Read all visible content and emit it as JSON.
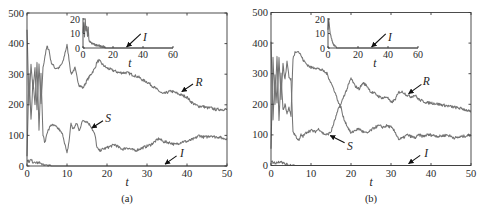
{
  "figure": {
    "panels": [
      "(a)",
      "(b)"
    ]
  },
  "chart_data": [
    {
      "type": "line",
      "panel_label": "(a)",
      "title": "",
      "xlabel": "t",
      "ylabel": "",
      "xlim": [
        0,
        50
      ],
      "ylim": [
        0,
        500
      ],
      "xticks": [
        0,
        10,
        20,
        30,
        40,
        50
      ],
      "yticks": [
        0,
        100,
        200,
        300,
        400,
        500
      ],
      "grid": false,
      "legend": "none (arrow annotations)",
      "series": [
        {
          "name": "R",
          "x": [
            0,
            0.5,
            1,
            1.5,
            2,
            2.5,
            3,
            3.5,
            4,
            4.5,
            5,
            5.5,
            6,
            7,
            8,
            9,
            9.5,
            10,
            10.5,
            11,
            11.5,
            12,
            12.5,
            13,
            14,
            15,
            16,
            17,
            17.5,
            18,
            19,
            20,
            21,
            22,
            23,
            24,
            25,
            26,
            27,
            28,
            29,
            30,
            31,
            32,
            33,
            34,
            35,
            36,
            37,
            38,
            39,
            40,
            41,
            42,
            43,
            44,
            45,
            46,
            47,
            48,
            49,
            50
          ],
          "y": [
            450,
            200,
            330,
            250,
            320,
            180,
            330,
            200,
            320,
            360,
            390,
            380,
            340,
            320,
            320,
            340,
            370,
            395,
            350,
            300,
            310,
            320,
            290,
            265,
            255,
            280,
            300,
            320,
            340,
            345,
            330,
            320,
            315,
            310,
            305,
            305,
            305,
            300,
            295,
            290,
            280,
            275,
            265,
            255,
            245,
            235,
            240,
            245,
            240,
            235,
            230,
            225,
            210,
            200,
            195,
            195,
            190,
            190,
            185,
            185,
            185,
            185
          ]
        },
        {
          "name": "S",
          "x": [
            0,
            0.5,
            1,
            1.5,
            2,
            2.5,
            3,
            3.5,
            4,
            4.5,
            5,
            5.5,
            6,
            7,
            8,
            9,
            9.5,
            10,
            10.5,
            11,
            11.5,
            12,
            12.5,
            13,
            14,
            15,
            16,
            17,
            17.5,
            18,
            19,
            20,
            21,
            22,
            23,
            24,
            25,
            26,
            27,
            28,
            29,
            30,
            31,
            32,
            33,
            34,
            35,
            36,
            37,
            38,
            39,
            40,
            41,
            42,
            43,
            44,
            45,
            46,
            47,
            48,
            49,
            50
          ],
          "y": [
            30,
            300,
            150,
            280,
            200,
            340,
            120,
            300,
            100,
            75,
            110,
            120,
            135,
            130,
            120,
            100,
            70,
            40,
            80,
            140,
            120,
            130,
            140,
            115,
            150,
            145,
            130,
            100,
            60,
            50,
            55,
            60,
            65,
            70,
            60,
            55,
            60,
            55,
            50,
            55,
            60,
            65,
            70,
            80,
            90,
            80,
            78,
            75,
            70,
            75,
            80,
            80,
            85,
            90,
            100,
            95,
            95,
            100,
            95,
            95,
            90,
            90
          ]
        },
        {
          "name": "I",
          "x": [
            0,
            0.5,
            1,
            1.5,
            2,
            2.5,
            3,
            3.5,
            4,
            4.5,
            5,
            6,
            50
          ],
          "y": [
            18,
            15,
            20,
            12,
            15,
            10,
            12,
            5,
            8,
            2,
            1,
            0,
            0
          ]
        }
      ],
      "annotations": [
        {
          "text": "R",
          "text_at": [
            43,
            275
          ],
          "arrow_from": [
            41.5,
            268
          ],
          "arrow_to": [
            38.7,
            243
          ]
        },
        {
          "text": "S",
          "text_at": [
            20.3,
            157
          ],
          "arrow_from": [
            19,
            148
          ],
          "arrow_to": [
            16.2,
            124
          ]
        },
        {
          "text": "I",
          "text_at": [
            38.7,
            42
          ],
          "arrow_from": [
            37.4,
            33
          ],
          "arrow_to": [
            34.5,
            6
          ]
        }
      ],
      "inset": {
        "type": "line",
        "xlabel": "t",
        "xlim": [
          0,
          60
        ],
        "ylim": [
          0,
          20
        ],
        "xticks": [
          0,
          20,
          40,
          60
        ],
        "yticks": [
          0,
          10,
          20
        ],
        "series": [
          {
            "name": "I",
            "x": [
              0,
              0.5,
              1,
              1.5,
              2,
              2.5,
              3,
              3.5,
              4,
              5,
              6,
              7,
              8,
              9,
              10,
              12,
              14,
              15,
              60
            ],
            "y": [
              10,
              18,
              8,
              20,
              12,
              15,
              8,
              14,
              5,
              4,
              3,
              3,
              2,
              2,
              2,
              1,
              1,
              0,
              0
            ]
          }
        ],
        "annotations": [
          {
            "text": "I",
            "text_at": [
              41.3,
              7.8
            ],
            "arrow_from": [
              38.5,
              9.7
            ],
            "arrow_to": [
              29.1,
              0.7
            ]
          }
        ]
      }
    },
    {
      "type": "line",
      "panel_label": "(b)",
      "title": "",
      "xlabel": "t",
      "ylabel": "",
      "xlim": [
        0,
        50
      ],
      "ylim": [
        0,
        500
      ],
      "xticks": [
        0,
        10,
        20,
        30,
        40,
        50
      ],
      "yticks": [
        0,
        100,
        200,
        300,
        400,
        500
      ],
      "grid": false,
      "legend": "none (arrow annotations)",
      "series": [
        {
          "name": "R",
          "x": [
            0,
            0.5,
            1,
            1.5,
            2,
            2.5,
            3,
            3.5,
            4,
            4.5,
            5,
            5.5,
            6,
            6.5,
            7,
            7.5,
            8,
            9,
            10,
            11,
            12,
            13,
            14,
            15,
            16,
            17,
            17.5,
            18,
            19,
            20,
            21,
            22,
            23,
            24,
            25,
            26,
            27,
            28,
            29,
            30,
            31,
            32,
            33,
            34,
            35,
            36,
            37,
            38,
            39,
            40,
            42,
            44,
            46,
            48,
            50
          ],
          "y": [
            400,
            150,
            300,
            200,
            350,
            220,
            330,
            280,
            340,
            290,
            280,
            110,
            100,
            90,
            80,
            100,
            95,
            110,
            115,
            110,
            120,
            105,
            100,
            110,
            150,
            190,
            200,
            220,
            250,
            285,
            260,
            250,
            270,
            260,
            240,
            235,
            225,
            220,
            225,
            205,
            215,
            240,
            240,
            230,
            225,
            230,
            215,
            210,
            205,
            205,
            200,
            195,
            190,
            185,
            175
          ]
        },
        {
          "name": "S",
          "x": [
            0,
            0.5,
            1,
            1.5,
            2,
            2.5,
            3,
            3.5,
            4,
            4.5,
            5,
            5.5,
            6,
            6.5,
            7,
            7.5,
            8,
            9,
            10,
            11,
            12,
            13,
            14,
            15,
            16,
            17,
            17.5,
            18,
            19,
            20,
            21,
            22,
            23,
            24,
            25,
            26,
            27,
            28,
            29,
            30,
            31,
            32,
            33,
            34,
            35,
            36,
            37,
            38,
            39,
            40,
            42,
            44,
            46,
            48,
            50
          ],
          "y": [
            50,
            350,
            200,
            360,
            150,
            300,
            180,
            200,
            170,
            190,
            160,
            350,
            370,
            375,
            370,
            360,
            345,
            330,
            320,
            320,
            315,
            310,
            300,
            270,
            240,
            200,
            190,
            160,
            130,
            105,
            115,
            120,
            110,
            105,
            115,
            125,
            130,
            125,
            130,
            125,
            110,
            85,
            90,
            100,
            95,
            90,
            100,
            95,
            100,
            100,
            95,
            100,
            90,
            95,
            100
          ]
        },
        {
          "name": "I",
          "x": [
            0,
            0.5,
            1,
            2,
            2.5,
            3,
            4,
            5,
            6,
            50
          ],
          "y": [
            15,
            10,
            8,
            12,
            15,
            8,
            3,
            1,
            0,
            0
          ]
        }
      ],
      "annotations": [
        {
          "text": "R",
          "text_at": [
            38.8,
            275
          ],
          "arrow_from": [
            37.6,
            265
          ],
          "arrow_to": [
            34.4,
            235
          ]
        },
        {
          "text": "S",
          "text_at": [
            19.7,
            63
          ],
          "arrow_from": [
            18.4,
            74
          ],
          "arrow_to": [
            14.8,
            98
          ]
        },
        {
          "text": "I",
          "text_at": [
            38.8,
            41
          ],
          "arrow_from": [
            37.3,
            33
          ],
          "arrow_to": [
            34.4,
            6
          ]
        }
      ],
      "inset": {
        "type": "line",
        "xlabel": "t",
        "xlim": [
          0,
          60
        ],
        "ylim": [
          0,
          20
        ],
        "xticks": [
          0,
          20,
          40,
          60
        ],
        "yticks": [
          0,
          10,
          20
        ],
        "series": [
          {
            "name": "I",
            "x": [
              0,
              0.5,
              1,
              1.5,
              2,
              3,
              4,
              5,
              6,
              60
            ],
            "y": [
              12,
              20,
              15,
              10,
              8,
              4,
              2,
              1,
              0,
              0
            ]
          }
        ],
        "annotations": [
          {
            "text": "I",
            "text_at": [
              41.3,
              7.8
            ],
            "arrow_from": [
              38.5,
              9.7
            ],
            "arrow_to": [
              29.1,
              0.7
            ]
          }
        ]
      }
    }
  ]
}
